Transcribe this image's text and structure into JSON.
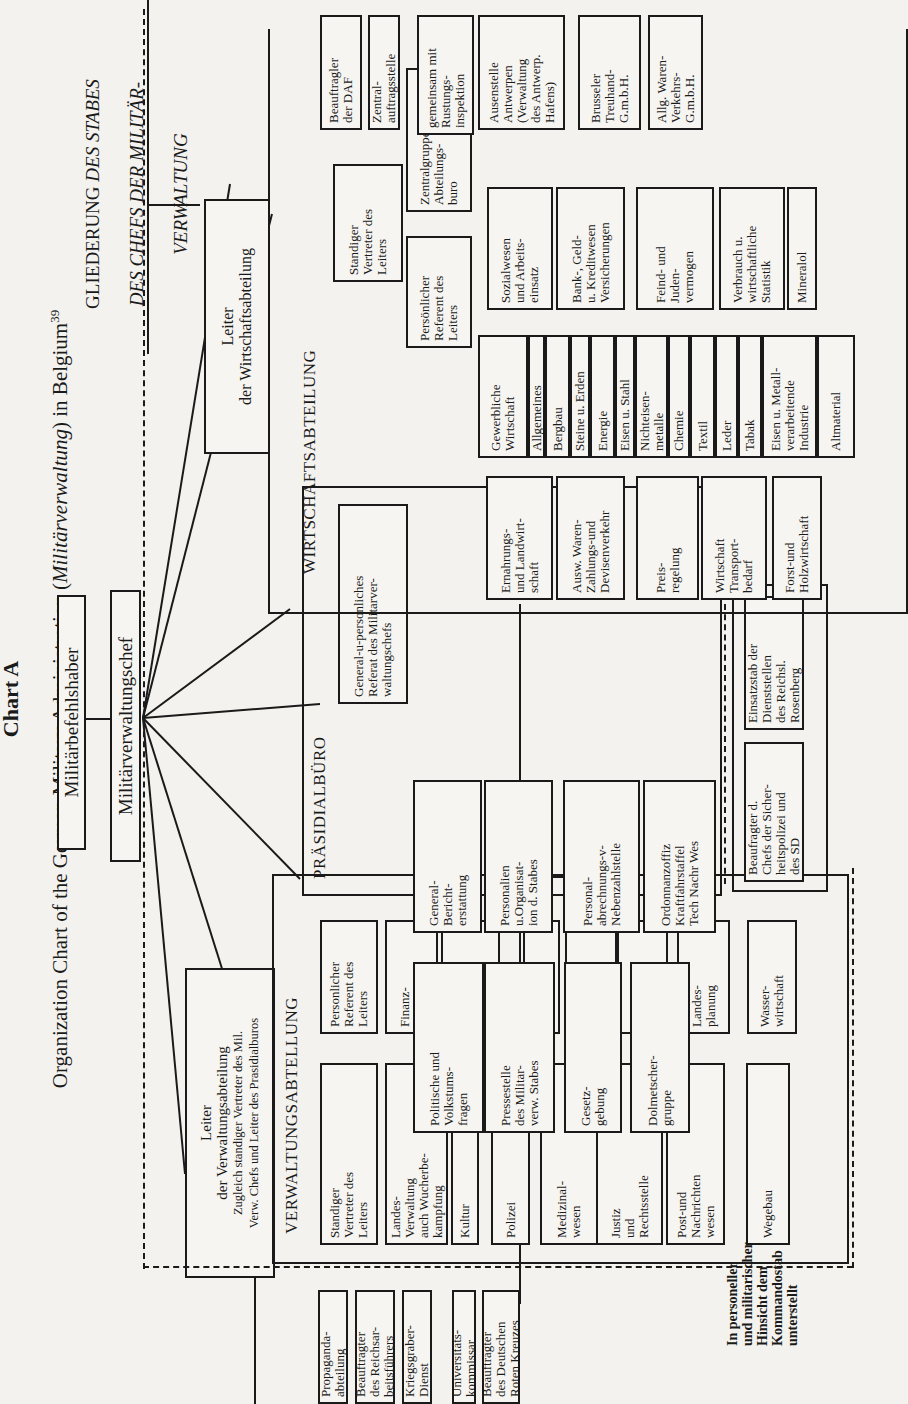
{
  "header": {
    "chart_label": "Chart A",
    "subtitle_pre": "Organization Chart of the German Military Administration (",
    "subtitle_italic": "Militärverwaltung",
    "subtitle_post": ") in Belgium",
    "footnote_ref": "39",
    "gliederung_line1_plain": "GLIEDERUNG ",
    "gliederung_line1_italic": "DES STABES",
    "gliederung_line2": "DES CHEFS DER MILITÄR-",
    "gliederung_line3": "VERWALTUNG"
  },
  "top": {
    "befehlshaber": "Militärbefehlshaber",
    "verwaltungschef": "Militärverwaltungschef"
  },
  "verwaltung": {
    "leiter": {
      "line1": "Leiter",
      "line2": "der Verwaltungsabteilung",
      "line3": "Zugleich standiger Vertreter des Mil.",
      "line4": "Verw. Chefs und Leiter des Prasidialburos"
    },
    "title": "VERWALTUNGSABTELLUNG",
    "units_left": [
      "Standiger\nVertreter des\nLeiters",
      "Landes-\nVerwaltung\nauch Wucherbe-\nkampfung",
      "Kultur",
      "Polizei",
      "Medizinal-\nwesen",
      "Justiz\nund\nRechtsstelle",
      "Post-und\nNachrichten\nwesen",
      "Wegebau"
    ],
    "units_right": [
      "Personlicher\nReferent des\nLeiters",
      "Finanz-\nwesen",
      "Propaganda\nund\nRundfunk",
      "Fursorge",
      "Veterinar-\nwesen",
      "Werkehrs-\nwesen",
      "Landes-\nplanung",
      "Wasser-\nwirtschaft"
    ],
    "attached": [
      "Propaganda-\nabteilung",
      "Beauftragter\ndes Reichsar-\nbeitsführers",
      "Kriegsgraber-\nDienst",
      "Universitats-\nkommissar",
      "Beauftragter\ndes Deutschen\nRoten Kreuzes"
    ],
    "note": "In personeller\nund militarischer\nHinsicht dem\nKommandostab\nunterstellt"
  },
  "praesidial": {
    "title": "PRÄSIDIALBÜRO",
    "referat": "General-u-personliches\nReferat des Militarver-\nwaltungschefs",
    "units_left": [
      "Politische und\nVolkstums-\nfragen",
      "Pressestelle\ndes Militar-\nverw. Stabes",
      "Gesetz-\ngebung",
      "Dolmetscher-\ngruppe"
    ],
    "units_right": [
      "General-\nBericht-\nerstattung",
      "Personalien\nu.Organisat-\nion d. Stabes",
      "Personal-\nabrechnungs-v-\nNebenzahlstelle",
      "Ordonnanzoffiz\nKraftfahrstaffel\nTech Nachr Wes"
    ]
  },
  "sonder": {
    "sd": "Beaufragter d.\nChefs der Sicher-\nheitspolizei und\ndes SD",
    "rosenberg": "Einsatzstab der\nDienststellen\ndes Reichsl.\nRosenberg"
  },
  "wirtschaft": {
    "leiter": "Leiter\nder Wirtschaftsabteilung",
    "title": "WIRTSCHAFTSABTEILUNG",
    "standiger": "Standiger\nVertreter des\nLeiters",
    "persoenlich": "Persönlicher\nReferent des\nLeiters",
    "zentral": "Zentralgruppe u.\nAbteilungs-\nburo",
    "left_col": [
      "Ernahrungs-\nund Landwirt-\nschaft",
      "Ausw. Waren-\nZahlungs-und\nDevisenverkehr",
      "Preis-\nregelung",
      "Wirtschaft\nTransport-\nbedarf",
      "Forst-und\nHolzwirtschaft"
    ],
    "gewerbliche_header": "Gewerbliche\nWirtschaft",
    "gewerbliche_items": [
      "Allgemeines",
      "Bergbau",
      "Steine u. Erden",
      "Energie",
      "Eisen u. Stahl",
      "Nichteisen-\nmetalle",
      "Chemie",
      "Textil",
      "Leder",
      "Tabak",
      "Eisen u. Metall-\nverarbeitende\nIndustrie",
      "Altmaterial"
    ],
    "right_col": [
      "Sozialwesen\nund Arbeits-\neinsatz",
      "Bank-, Geld-\nu. Kreditwesen\nVersicherungen",
      "Feind- und\nJuden-\nvermogen",
      "Verbrauch u.\nwirtschaftliche\nStatistik",
      "Mineralol"
    ],
    "attached": [
      "Beauftragler\nder DAF",
      "Zentral-\nauftragsstelle",
      "gemeinsam mit\nRustungs-\ninspektion",
      "Ausenstelle\nAntwerpen\n(Verwaltung\ndes Antwerp.\nHafens)",
      "Brusseler\nTreuhand-\nG.m.b.H.",
      "Allg. Waren-\nVerkehrs-\nG.m.b.H."
    ]
  }
}
